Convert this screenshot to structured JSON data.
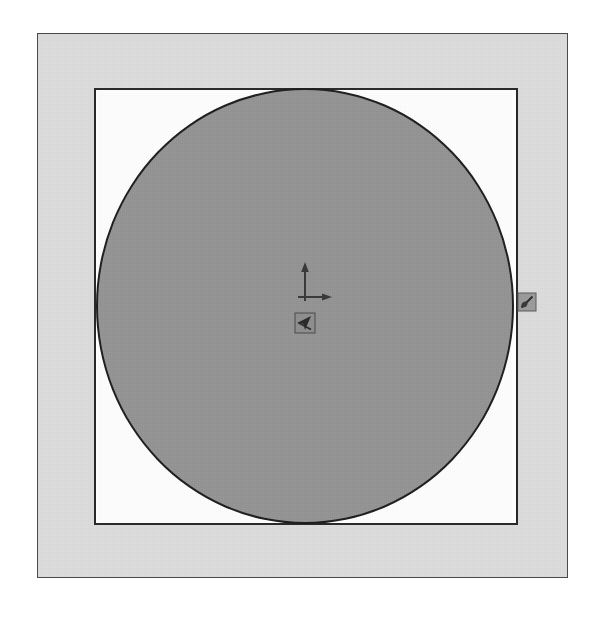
{
  "canvas": {
    "title": "Drawing Canvas",
    "background_color": "#ffffff",
    "width": 592,
    "height": 618
  },
  "sheet": {
    "name": "drawing-sheet",
    "fill_color": "#dcdcdc",
    "border_color": "#4a4a4a",
    "x": 37,
    "y": 33,
    "width": 531,
    "height": 545
  },
  "viewport": {
    "name": "viewport-rectangle",
    "fill_color": "#fefefe",
    "border_color": "#2a2a2a",
    "x": 94,
    "y": 88,
    "width": 424,
    "height": 437
  },
  "entities": [
    {
      "type": "circle",
      "name": "shaded-circle",
      "fill_color": "#949494",
      "stroke_color": "#1e1e1e",
      "center_x": 305,
      "center_y": 306,
      "radius_x": 209,
      "radius_y": 218
    }
  ],
  "ucs": {
    "name": "ucs-axis-indicator",
    "x_axis_label": "",
    "y_axis_label": "",
    "color": "#3a3a3a",
    "origin_x": 305,
    "origin_y": 296
  },
  "cursor": {
    "name": "pick-box-cursor",
    "color": "#3a3a3a",
    "x": 305,
    "y": 323
  },
  "handle": {
    "name": "edge-grip-handle",
    "color": "#4a4a4a",
    "x": 527,
    "y": 302
  },
  "chart_data": {
    "type": "scatter",
    "title": "",
    "xlabel": "",
    "ylabel": "",
    "x": [
      305
    ],
    "y": [
      306
    ],
    "annotations": [
      "shaded circle inscribed in viewport rectangle"
    ],
    "grid": false,
    "legend": "none"
  }
}
